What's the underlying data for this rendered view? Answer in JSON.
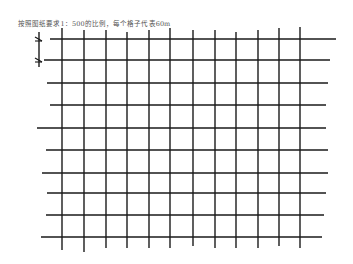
{
  "caption": "按照图纸要求1：500的比例，每个格子代表60m",
  "grid": {
    "line_color": "#1a1a1a",
    "horizontal_lines": [
      {
        "y": 39,
        "x1": 50,
        "x2": 336
      },
      {
        "y": 60,
        "x1": 44,
        "x2": 330
      },
      {
        "y": 83,
        "x1": 47,
        "x2": 328
      },
      {
        "y": 105,
        "x1": 50,
        "x2": 326
      },
      {
        "y": 128,
        "x1": 37,
        "x2": 326
      },
      {
        "y": 150,
        "x1": 46,
        "x2": 328
      },
      {
        "y": 173,
        "x1": 42,
        "x2": 328
      },
      {
        "y": 193,
        "x1": 47,
        "x2": 326
      },
      {
        "y": 215,
        "x1": 46,
        "x2": 324
      },
      {
        "y": 237,
        "x1": 41,
        "x2": 322
      }
    ],
    "vertical_lines": [
      {
        "x": 62,
        "y1": 28,
        "y2": 250
      },
      {
        "x": 84,
        "y1": 30,
        "y2": 252
      },
      {
        "x": 106,
        "y1": 30,
        "y2": 248
      },
      {
        "x": 127,
        "y1": 32,
        "y2": 248
      },
      {
        "x": 149,
        "y1": 30,
        "y2": 248
      },
      {
        "x": 170,
        "y1": 28,
        "y2": 248
      },
      {
        "x": 193,
        "y1": 30,
        "y2": 246
      },
      {
        "x": 215,
        "y1": 30,
        "y2": 248
      },
      {
        "x": 236,
        "y1": 32,
        "y2": 248
      },
      {
        "x": 258,
        "y1": 30,
        "y2": 248
      },
      {
        "x": 279,
        "y1": 28,
        "y2": 246
      },
      {
        "x": 300,
        "y1": 27,
        "y2": 248
      }
    ]
  },
  "scale_marker": {
    "x": 39,
    "y1": 32,
    "y2": 67,
    "tick_top": 40,
    "tick_bottom": 61
  }
}
